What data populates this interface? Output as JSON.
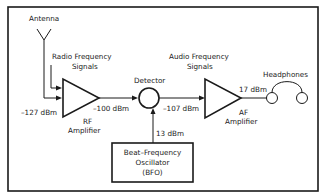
{
  "diagram": {
    "nodes": {
      "antenna": {
        "label": "Antenna"
      },
      "rf_signals": {
        "line1": "Radio Frequency",
        "line2": "Signals"
      },
      "rf_amplifier": {
        "line1": "RF",
        "line2": "Amplifier"
      },
      "detector": {
        "label": "Detector"
      },
      "af_signals": {
        "line1": "Audio Frequency",
        "line2": "Signals"
      },
      "af_amplifier": {
        "line1": "AF",
        "line2": "Amplifier"
      },
      "headphones": {
        "label": "Headphones"
      },
      "bfo": {
        "line1": "Beat–Frequency",
        "line2": "Oscillator",
        "line3": "(BFO)"
      }
    },
    "levels": {
      "rf_input": "–127 dBm",
      "rf_output": "–100 dBm",
      "detector_output": "–107 dBm",
      "bfo_output": "13 dBm",
      "af_output": "17 dBm"
    },
    "colors": {
      "line": "#1a1a1a",
      "background": "#ffffff"
    }
  }
}
